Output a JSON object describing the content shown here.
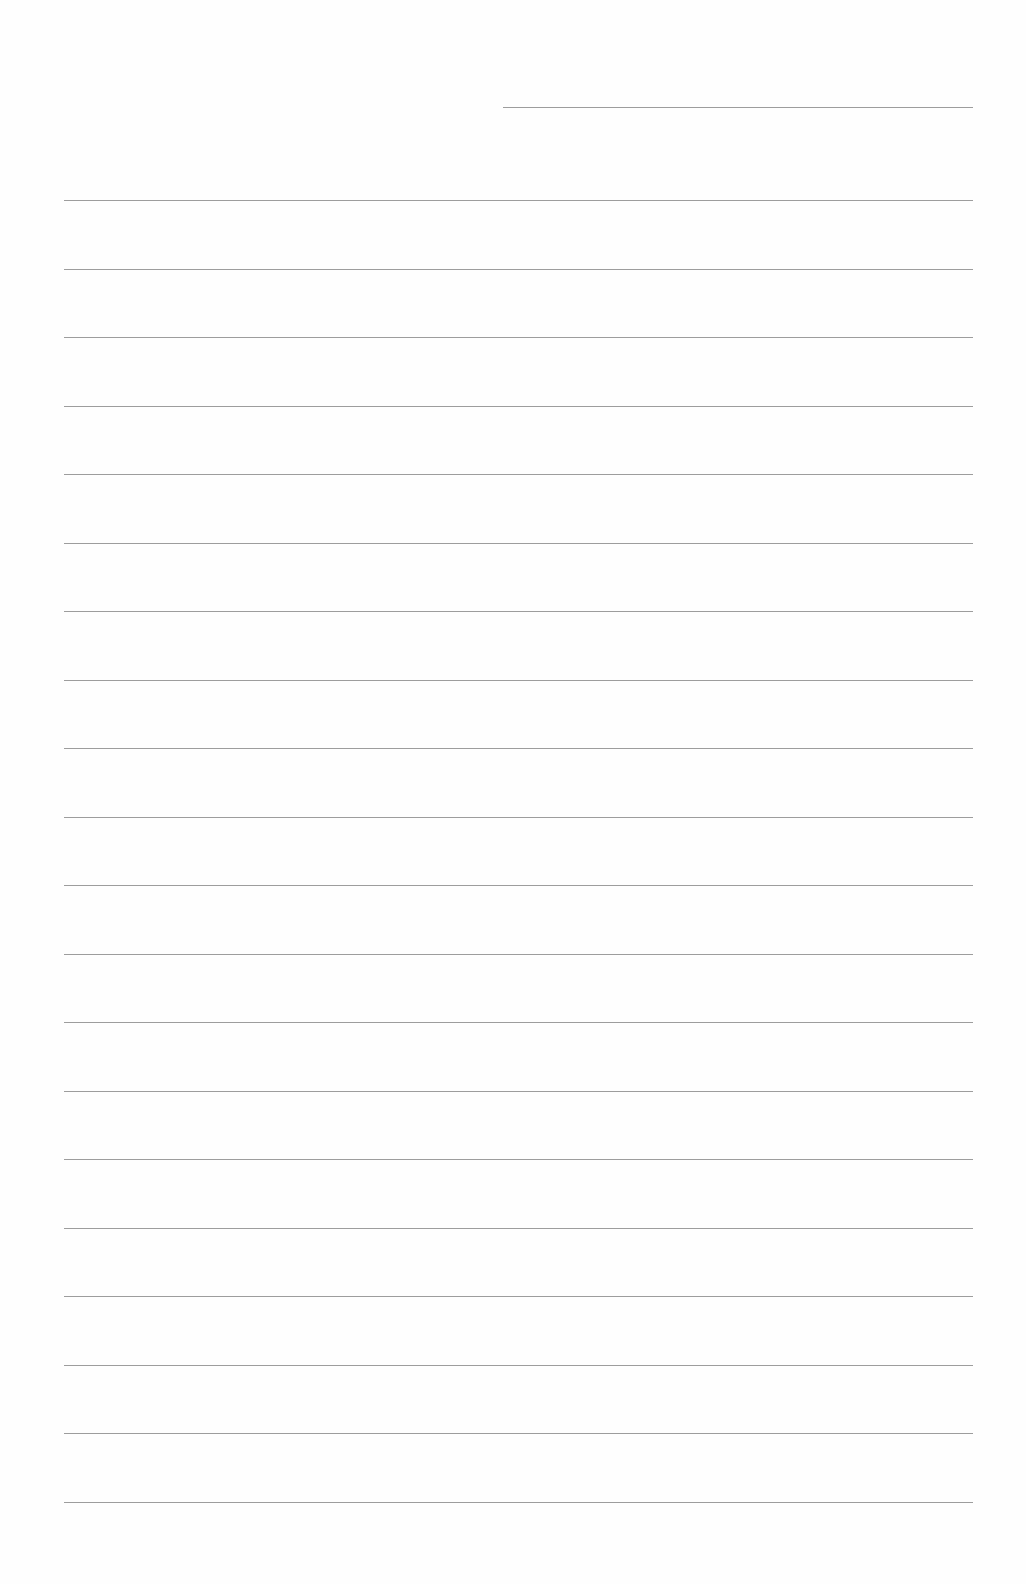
{
  "document": {
    "type": "lined-paper",
    "background_color": "#ffffff",
    "line_color": "#8c8c8c",
    "header_line": {
      "present": true,
      "text": ""
    },
    "body_lines_count": 20,
    "body_lines": [
      "",
      "",
      "",
      "",
      "",
      "",
      "",
      "",
      "",
      "",
      "",
      "",
      "",
      "",
      "",
      "",
      "",
      "",
      "",
      ""
    ]
  }
}
